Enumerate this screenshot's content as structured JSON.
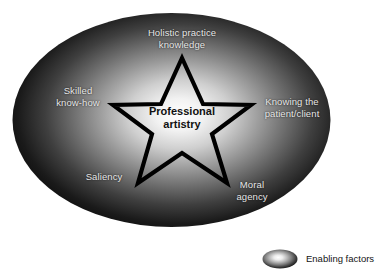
{
  "diagram": {
    "title_center": "Professional\nartistry",
    "center_text_color": "#111111",
    "label_color": "#e8e8e8",
    "background_color": "#ffffff",
    "ellipse_gradient": {
      "center_color": "#ffffff",
      "mid_color": "#8a8a8a",
      "edge_color": "#000000"
    },
    "star": {
      "stroke_color": "#000000",
      "points": 5
    },
    "nodes": [
      {
        "id": "holistic-practice-knowledge",
        "label": "Holistic practice\nknowledge"
      },
      {
        "id": "skilled-know-how",
        "label": "Skilled\nknow-how"
      },
      {
        "id": "knowing-the-patient-client",
        "label": "Knowing the\npatient/client"
      },
      {
        "id": "saliency",
        "label": "Saliency"
      },
      {
        "id": "moral-agency",
        "label": "Moral\nagency"
      }
    ]
  },
  "legend": {
    "swatch_name": "ellipse-swatch",
    "label": "Enabling factors"
  }
}
